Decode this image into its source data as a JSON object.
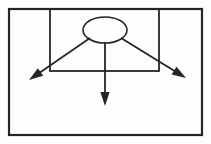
{
  "figure": {
    "canvas": {
      "width": 211,
      "height": 144
    },
    "background_color": "#fdfdfc",
    "stroke_color": "#262626",
    "fill_color": "none"
  },
  "chart_data": {
    "type": "diagram",
    "xlabel": "",
    "ylabel": "",
    "grid": false,
    "legend": "none",
    "shapes": [
      {
        "name": "outer-frame",
        "kind": "rectangle",
        "x": 9,
        "y": 9,
        "width": 193,
        "height": 126,
        "stroke_width": 2.2
      },
      {
        "name": "inner-frame",
        "kind": "rectangle",
        "x": 50,
        "y": 9,
        "width": 109,
        "height": 62,
        "stroke_width": 1.8
      },
      {
        "name": "ellipse-source",
        "kind": "ellipse",
        "cx": 105,
        "cy": 30,
        "rx": 22,
        "ry": 13,
        "stroke_width": 1.6
      }
    ],
    "arrows": [
      {
        "name": "arrow-down-left",
        "direction": "down-left",
        "x1": 90,
        "y1": 38,
        "x2": 29,
        "y2": 80,
        "stroke_width": 1.8,
        "arrowhead": "solid-triangle"
      },
      {
        "name": "arrow-down",
        "direction": "down",
        "x1": 105,
        "y1": 42,
        "x2": 105,
        "y2": 106,
        "stroke_width": 1.8,
        "arrowhead": "solid-triangle"
      },
      {
        "name": "arrow-down-right",
        "direction": "down-right",
        "x1": 121,
        "y1": 38,
        "x2": 186,
        "y2": 78,
        "stroke_width": 1.8,
        "arrowhead": "solid-triangle"
      }
    ],
    "annotations": [],
    "labels": []
  }
}
